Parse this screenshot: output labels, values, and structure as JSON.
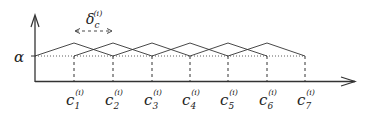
{
  "diagram": {
    "type": "overlapping-triangular-membership-functions",
    "y_axis_label": "α",
    "delta_label": "δ",
    "delta_sub": "c",
    "delta_sup": "(i)",
    "centers": [
      {
        "base": "c",
        "sub": "1",
        "sup": "(i)",
        "x": 74
      },
      {
        "base": "c",
        "sub": "2",
        "sup": "(i)",
        "x": 113
      },
      {
        "base": "c",
        "sub": "3",
        "sup": "(i)",
        "x": 152
      },
      {
        "base": "c",
        "sub": "4",
        "sup": "(i)",
        "x": 190
      },
      {
        "base": "c",
        "sub": "5",
        "sup": "(i)",
        "x": 228
      },
      {
        "base": "c",
        "sub": "6",
        "sup": "(i)",
        "x": 267
      },
      {
        "base": "c",
        "sub": "7",
        "sup": "(i)",
        "x": 305
      }
    ],
    "line_color": "#333333"
  }
}
